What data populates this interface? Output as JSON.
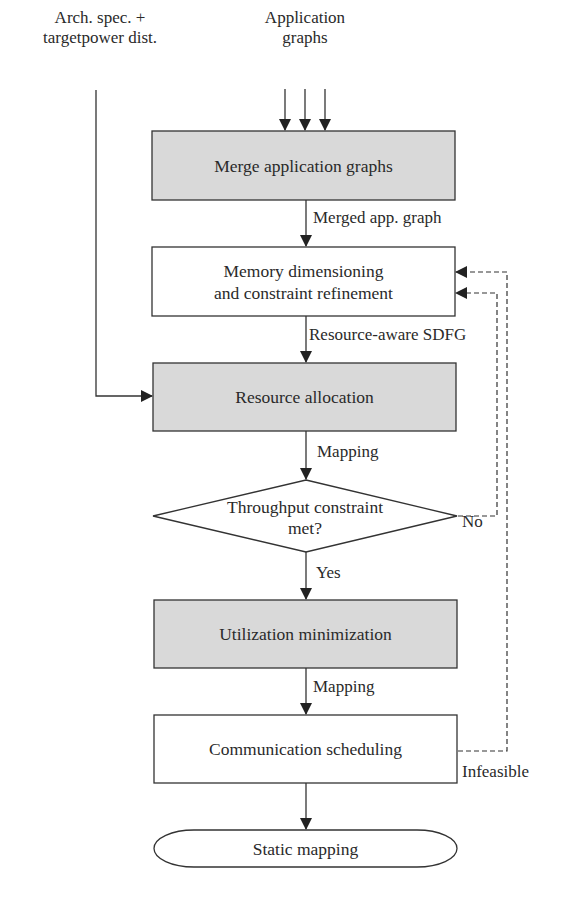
{
  "inputs": {
    "arch_spec_line1": "Arch. spec. +",
    "arch_spec_line2": "targetpower dist.",
    "app_graphs_line1": "Application",
    "app_graphs_line2": "graphs"
  },
  "nodes": {
    "merge": "Merge application graphs",
    "memory_line1": "Memory dimensioning",
    "memory_line2": "and constraint refinement",
    "resource": "Resource allocation",
    "decision_line1": "Throughput constraint",
    "decision_line2": "met?",
    "utilization": "Utilization minimization",
    "communication": "Communication scheduling",
    "output": "Static mapping"
  },
  "edges": {
    "merged_graph": "Merged app. graph",
    "resource_sdfg": "Resource-aware SDFG",
    "mapping1": "Mapping",
    "no": "No",
    "yes": "Yes",
    "mapping2": "Mapping",
    "infeasible": "Infeasible"
  },
  "colors": {
    "shaded_fill": "#d9d9d9",
    "stroke": "#333333",
    "background": "#ffffff"
  }
}
